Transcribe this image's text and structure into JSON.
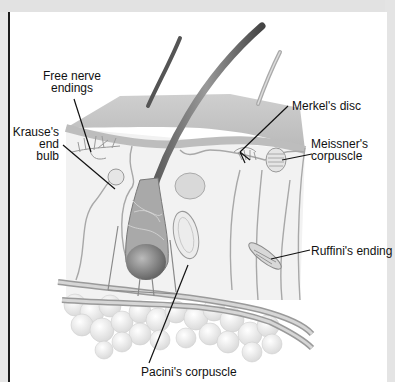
{
  "diagram": {
    "labels": {
      "free_nerve": [
        "Free nerve",
        "endings"
      ],
      "krause": [
        "Krause's",
        "end",
        "bulb"
      ],
      "merkel": [
        "Merkel's disc"
      ],
      "meissner": [
        "Meissner's",
        "corpuscle"
      ],
      "ruffini": [
        "Ruffini's ending"
      ],
      "pacini": [
        "Pacini's corpuscle"
      ]
    },
    "colors": {
      "panel": "#ffffff",
      "border": "#1a1a1a",
      "background": "#e6e6e6",
      "epidermis": "#c9c9c9",
      "dermis": "#f1f1f1",
      "leader_line": "#111111"
    }
  }
}
